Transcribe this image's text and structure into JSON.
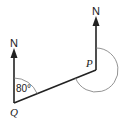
{
  "diagram": {
    "type": "bearing-diagram",
    "points": {
      "Q": {
        "label": "Q"
      },
      "P": {
        "label": "P"
      }
    },
    "north_labels": {
      "at_Q": "N",
      "at_P": "N"
    },
    "angle_at_Q": "80°",
    "colors": {
      "line": "#222222",
      "arc": "#555555",
      "background": "#ffffff"
    }
  }
}
